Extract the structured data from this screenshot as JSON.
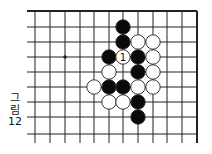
{
  "figure": {
    "caption_lines": [
      "그",
      "림",
      "12"
    ],
    "caption": "그림 12"
  },
  "board": {
    "grid": {
      "columns_x": [
        35,
        50,
        65,
        80,
        94,
        109,
        123,
        138,
        153,
        167,
        182,
        197
      ],
      "rows_y": [
        11,
        27,
        42,
        57,
        72,
        87,
        102,
        117,
        134
      ],
      "line_left": 27,
      "line_bottom": 143,
      "edges": [
        "top",
        "right"
      ]
    },
    "star_points": [
      {
        "col": 2,
        "row": 3
      }
    ],
    "stones": [
      {
        "color": "black",
        "col": 6,
        "row": 1
      },
      {
        "color": "black",
        "col": 6,
        "row": 2
      },
      {
        "color": "white",
        "col": 7,
        "row": 2
      },
      {
        "color": "white",
        "col": 8,
        "row": 2
      },
      {
        "color": "black",
        "col": 5,
        "row": 3
      },
      {
        "color": "white",
        "col": 6,
        "row": 3,
        "label": "1"
      },
      {
        "color": "black",
        "col": 7,
        "row": 3
      },
      {
        "color": "white",
        "col": 8,
        "row": 3
      },
      {
        "color": "white",
        "col": 5,
        "row": 4
      },
      {
        "color": "black",
        "col": 7,
        "row": 4
      },
      {
        "color": "white",
        "col": 8,
        "row": 4
      },
      {
        "color": "white",
        "col": 4,
        "row": 5
      },
      {
        "color": "black",
        "col": 5,
        "row": 5
      },
      {
        "color": "black",
        "col": 6,
        "row": 5
      },
      {
        "color": "white",
        "col": 7,
        "row": 5
      },
      {
        "color": "white",
        "col": 8,
        "row": 5
      },
      {
        "color": "white",
        "col": 5,
        "row": 6
      },
      {
        "color": "white",
        "col": 6,
        "row": 6
      },
      {
        "color": "black",
        "col": 7,
        "row": 6
      },
      {
        "color": "black",
        "col": 7,
        "row": 7
      }
    ],
    "colors": {
      "line": "#222222",
      "black_stone": "#0a0a0a",
      "white_stone": "#ffffff",
      "stone_outline": "#222222"
    }
  }
}
